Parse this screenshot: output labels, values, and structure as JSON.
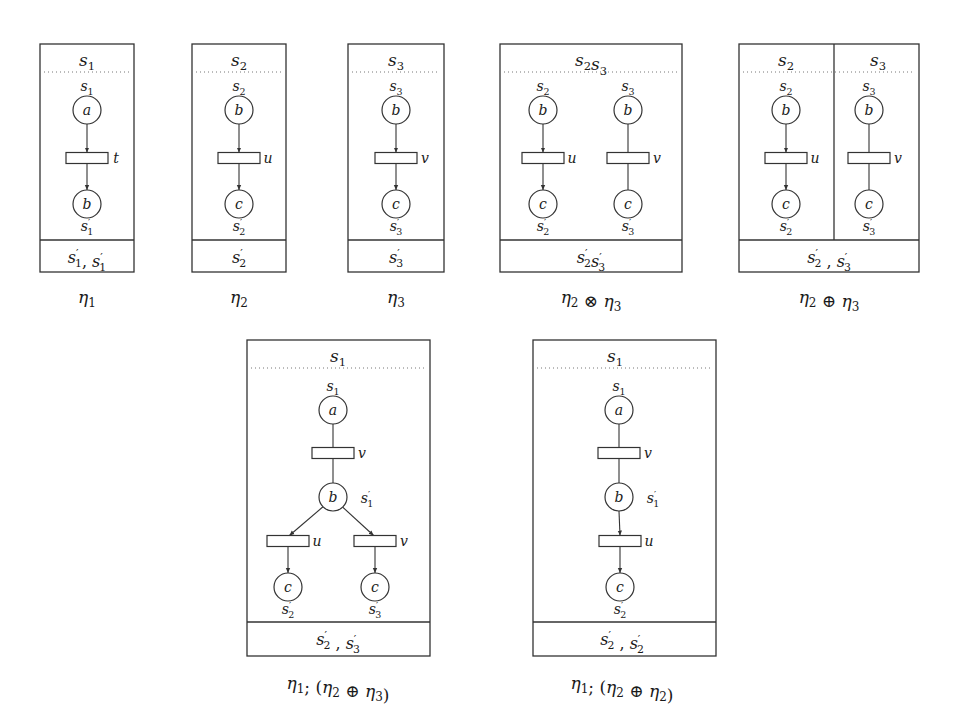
{
  "figure": {
    "panels": [
      {
        "id": "eta1",
        "caption": "η1",
        "caption_parts": [
          {
            "t": "η",
            "sub": "1"
          }
        ],
        "box": {
          "x": 40,
          "y": 44,
          "w": 94,
          "h": 228,
          "footer_y": 240
        },
        "headers": [
          {
            "x": 87,
            "text": "s",
            "sub": "1"
          }
        ],
        "footer": [
          {
            "text": "s",
            "sub": "1",
            "prime": true
          },
          {
            "text": ", "
          },
          {
            "text": "s",
            "sub": "1",
            "prime": true
          }
        ],
        "footer_x": 87,
        "caption_x": 87,
        "caption_y": 303,
        "dividers": [],
        "nodes": [
          {
            "kind": "place",
            "x": 87,
            "y": 110,
            "label": "a",
            "top": {
              "text": "s",
              "sub": "1"
            }
          },
          {
            "kind": "trans",
            "x": 87,
            "y": 158,
            "label": "t"
          },
          {
            "kind": "place",
            "x": 87,
            "y": 204,
            "label": "b",
            "bottom": {
              "text": "s",
              "sub": "1",
              "prime": true
            }
          }
        ],
        "arcs": [
          [
            0,
            1,
            true
          ],
          [
            1,
            2,
            true
          ]
        ]
      },
      {
        "id": "eta2",
        "caption": "η2",
        "caption_parts": [
          {
            "t": "η",
            "sub": "2"
          }
        ],
        "box": {
          "x": 192,
          "y": 44,
          "w": 94,
          "h": 228,
          "footer_y": 240
        },
        "headers": [
          {
            "x": 239,
            "text": "s",
            "sub": "2"
          }
        ],
        "footer": [
          {
            "text": "s",
            "sub": "2",
            "prime": true
          }
        ],
        "footer_x": 239,
        "caption_x": 239,
        "caption_y": 303,
        "dividers": [],
        "nodes": [
          {
            "kind": "place",
            "x": 239,
            "y": 110,
            "label": "b",
            "top": {
              "text": "s",
              "sub": "2"
            }
          },
          {
            "kind": "trans",
            "x": 239,
            "y": 158,
            "label": "u"
          },
          {
            "kind": "place",
            "x": 239,
            "y": 204,
            "label": "c",
            "bottom": {
              "text": "s",
              "sub": "2",
              "prime": true
            }
          }
        ],
        "arcs": [
          [
            0,
            1,
            true
          ],
          [
            1,
            2,
            true
          ]
        ]
      },
      {
        "id": "eta3",
        "caption": "η3",
        "caption_parts": [
          {
            "t": "η",
            "sub": "3"
          }
        ],
        "box": {
          "x": 348,
          "y": 44,
          "w": 96,
          "h": 228,
          "footer_y": 240
        },
        "headers": [
          {
            "x": 396,
            "text": "s",
            "sub": "3"
          }
        ],
        "footer": [
          {
            "text": "s",
            "sub": "3",
            "prime": true
          }
        ],
        "footer_x": 396,
        "caption_x": 396,
        "caption_y": 303,
        "dividers": [],
        "nodes": [
          {
            "kind": "place",
            "x": 396,
            "y": 110,
            "label": "b",
            "top": {
              "text": "s",
              "sub": "3"
            }
          },
          {
            "kind": "trans",
            "x": 396,
            "y": 158,
            "label": "v"
          },
          {
            "kind": "place",
            "x": 396,
            "y": 204,
            "label": "c",
            "bottom": {
              "text": "s",
              "sub": "3",
              "prime": true
            }
          }
        ],
        "arcs": [
          [
            0,
            1,
            true
          ],
          [
            1,
            2,
            true
          ]
        ]
      },
      {
        "id": "eta2-tensor-eta3",
        "caption": "η2 ⊗ η3",
        "caption_parts": [
          {
            "t": "η",
            "sub": "2"
          },
          {
            "op": " ⊗ "
          },
          {
            "t": "η",
            "sub": "3"
          }
        ],
        "box": {
          "x": 500,
          "y": 44,
          "w": 182,
          "h": 228,
          "footer_y": 240
        },
        "headers": [
          {
            "x": 591,
            "text": "s",
            "sub": "2",
            "text2": "s",
            "sub2": "3"
          }
        ],
        "footer": [
          {
            "text": "s",
            "sub": "2",
            "prime": true
          },
          {
            "text": "s",
            "sub": "3",
            "prime": true
          }
        ],
        "footer_x": 591,
        "caption_x": 591,
        "caption_y": 303,
        "dividers": [],
        "nodes": [
          {
            "kind": "place",
            "x": 543,
            "y": 110,
            "label": "b",
            "top": {
              "text": "s",
              "sub": "2"
            }
          },
          {
            "kind": "trans",
            "x": 543,
            "y": 158,
            "label": "u"
          },
          {
            "kind": "place",
            "x": 543,
            "y": 204,
            "label": "c",
            "bottom": {
              "text": "s",
              "sub": "2",
              "prime": true
            }
          },
          {
            "kind": "place",
            "x": 628,
            "y": 110,
            "label": "b",
            "top": {
              "text": "s",
              "sub": "3"
            }
          },
          {
            "kind": "trans",
            "x": 628,
            "y": 158,
            "label": "v"
          },
          {
            "kind": "place",
            "x": 628,
            "y": 204,
            "label": "c",
            "bottom": {
              "text": "s",
              "sub": "3",
              "prime": true
            }
          }
        ],
        "arcs": [
          [
            0,
            1,
            true
          ],
          [
            1,
            2,
            true
          ],
          [
            3,
            4,
            false
          ],
          [
            4,
            5,
            false
          ]
        ]
      },
      {
        "id": "eta2-oplus-eta3",
        "caption": "η2 ⊕ η3",
        "caption_parts": [
          {
            "t": "η",
            "sub": "2"
          },
          {
            "op": " ⊕ "
          },
          {
            "t": "η",
            "sub": "3"
          }
        ],
        "box": {
          "x": 739,
          "y": 44,
          "w": 180,
          "h": 228,
          "footer_y": 240
        },
        "headers": [
          {
            "x": 786,
            "text": "s",
            "sub": "2"
          },
          {
            "x": 878,
            "text": "s",
            "sub": "3"
          }
        ],
        "footer": [
          {
            "text": "s",
            "sub": "2",
            "prime": true
          },
          {
            "text": " , "
          },
          {
            "text": "s",
            "sub": "3",
            "prime": true
          }
        ],
        "footer_x": 829,
        "caption_x": 829,
        "caption_y": 303,
        "dividers": [
          {
            "x": 834,
            "y1": 44,
            "y2": 240
          }
        ],
        "nodes": [
          {
            "kind": "place",
            "x": 786,
            "y": 110,
            "label": "b",
            "top": {
              "text": "s",
              "sub": "2"
            }
          },
          {
            "kind": "trans",
            "x": 786,
            "y": 158,
            "label": "u"
          },
          {
            "kind": "place",
            "x": 786,
            "y": 204,
            "label": "c",
            "bottom": {
              "text": "s",
              "sub": "2",
              "prime": true
            }
          },
          {
            "kind": "place",
            "x": 869,
            "y": 110,
            "label": "b",
            "top": {
              "text": "s",
              "sub": "3"
            }
          },
          {
            "kind": "trans",
            "x": 869,
            "y": 158,
            "label": "v"
          },
          {
            "kind": "place",
            "x": 869,
            "y": 204,
            "label": "c",
            "bottom": {
              "text": "s",
              "sub": "3",
              "prime": true
            }
          }
        ],
        "arcs": [
          [
            0,
            1,
            true
          ],
          [
            1,
            2,
            true
          ],
          [
            3,
            4,
            false
          ],
          [
            4,
            5,
            false
          ]
        ]
      },
      {
        "id": "eta1-seq-eta2-oplus-eta3",
        "caption": "η1; (η2 ⊕ η3)",
        "caption_parts": [
          {
            "t": "η",
            "sub": "1"
          },
          {
            "op": "; ("
          },
          {
            "t": "η",
            "sub": "2"
          },
          {
            "op": " ⊕ "
          },
          {
            "t": "η",
            "sub": "3"
          },
          {
            "op": ")"
          }
        ],
        "box": {
          "x": 247,
          "y": 340,
          "w": 183,
          "h": 316,
          "footer_y": 622
        },
        "headers": [
          {
            "x": 338,
            "text": "s",
            "sub": "1"
          }
        ],
        "footer": [
          {
            "text": "s",
            "sub": "2",
            "prime": true
          },
          {
            "text": " , "
          },
          {
            "text": "s",
            "sub": "3",
            "prime": true
          }
        ],
        "footer_x": 338,
        "caption_x": 338,
        "caption_y": 689,
        "dividers": [],
        "nodes": [
          {
            "kind": "place",
            "x": 333,
            "y": 410,
            "label": "a",
            "top": {
              "text": "s",
              "sub": "1"
            }
          },
          {
            "kind": "trans",
            "x": 333,
            "y": 453,
            "label": "v"
          },
          {
            "kind": "place",
            "x": 333,
            "y": 497,
            "label": "b",
            "right": {
              "text": "s",
              "sub": "1",
              "prime": true
            }
          },
          {
            "kind": "trans",
            "x": 288,
            "y": 541,
            "label": "u"
          },
          {
            "kind": "trans",
            "x": 375,
            "y": 541,
            "label": "v"
          },
          {
            "kind": "place",
            "x": 288,
            "y": 587,
            "label": "c",
            "bottom": {
              "text": "s",
              "sub": "2",
              "prime": true
            }
          },
          {
            "kind": "place",
            "x": 375,
            "y": 587,
            "label": "c",
            "bottom": {
              "text": "s",
              "sub": "3",
              "prime": true
            }
          }
        ],
        "arcs": [
          [
            0,
            1,
            false
          ],
          [
            1,
            2,
            false
          ],
          [
            2,
            3,
            true
          ],
          [
            2,
            4,
            true
          ],
          [
            3,
            5,
            true
          ],
          [
            4,
            6,
            true
          ]
        ]
      },
      {
        "id": "eta1-seq-eta2-oplus-eta2",
        "caption": "η1; (η2 ⊕ η2)",
        "caption_parts": [
          {
            "t": "η",
            "sub": "1"
          },
          {
            "op": "; ("
          },
          {
            "t": "η",
            "sub": "2"
          },
          {
            "op": " ⊕ "
          },
          {
            "t": "η",
            "sub": "2"
          },
          {
            "op": ")"
          }
        ],
        "box": {
          "x": 533,
          "y": 340,
          "w": 183,
          "h": 316,
          "footer_y": 622
        },
        "headers": [
          {
            "x": 615,
            "text": "s",
            "sub": "1"
          }
        ],
        "footer": [
          {
            "text": "s",
            "sub": "2",
            "prime": true
          },
          {
            "text": " , "
          },
          {
            "text": "s",
            "sub": "2",
            "prime": true
          }
        ],
        "footer_x": 622,
        "caption_x": 622,
        "caption_y": 689,
        "dividers": [],
        "nodes": [
          {
            "kind": "place",
            "x": 619,
            "y": 410,
            "label": "a",
            "top": {
              "text": "s",
              "sub": "1"
            }
          },
          {
            "kind": "trans",
            "x": 619,
            "y": 453,
            "label": "v"
          },
          {
            "kind": "place",
            "x": 619,
            "y": 497,
            "label": "b",
            "right": {
              "text": "s",
              "sub": "1",
              "prime": true
            }
          },
          {
            "kind": "trans",
            "x": 620,
            "y": 541,
            "label": "u"
          },
          {
            "kind": "place",
            "x": 620,
            "y": 587,
            "label": "c",
            "bottom": {
              "text": "s",
              "sub": "2",
              "prime": true
            }
          }
        ],
        "arcs": [
          [
            0,
            1,
            false
          ],
          [
            1,
            2,
            false
          ],
          [
            2,
            3,
            true
          ],
          [
            3,
            4,
            true
          ]
        ]
      }
    ]
  }
}
